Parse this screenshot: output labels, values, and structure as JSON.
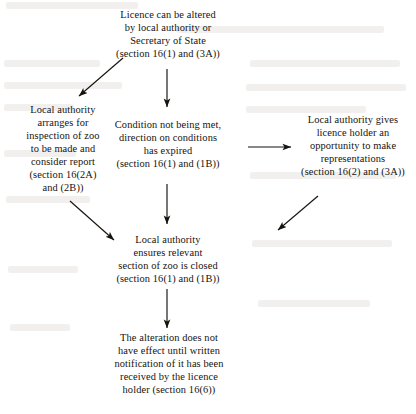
{
  "diagram": {
    "ink_color": "#16130f",
    "background_color": "#ffffff"
  },
  "nodes": {
    "top": {
      "name": "licence-can-be-altered",
      "lines": [
        "Licence can be altered",
        "by local authority or",
        "Secretary of State",
        "(section 16(1) and (3A))"
      ]
    },
    "left": {
      "name": "local-authority-arranges-inspection",
      "lines": [
        "Local authority",
        "arranges for",
        "inspection of zoo",
        "to be made and",
        "consider report",
        "(section 16(2A)",
        "and (2B))"
      ]
    },
    "center": {
      "name": "condition-not-being-met",
      "lines": [
        "Condition not being met,",
        "direction on conditions",
        "has expired",
        "(section 16(1) and (1B))"
      ]
    },
    "right": {
      "name": "opportunity-to-make-representations",
      "lines": [
        "Local authority gives",
        "licence holder an",
        "opportunity to make",
        "representations",
        "(section 16(2) and (3A))"
      ]
    },
    "closure": {
      "name": "local-authority-ensures-section-closed",
      "lines": [
        "Local authority",
        "ensures relevant",
        "section of zoo is closed",
        "(section 16(1) and (1B))"
      ]
    },
    "bottom": {
      "name": "alteration-effect-on-notification",
      "lines": [
        "The alteration does not",
        "have effect until written",
        "notification of it has been",
        "received by the licence",
        "holder (section 16(6))"
      ]
    }
  },
  "edges": [
    {
      "id": "top-to-left",
      "label": "arrow down-left from licence-can-be-altered to local-authority-arranges-inspection",
      "direction": "down-left"
    },
    {
      "id": "top-to-center",
      "label": "arrow down from licence-can-be-altered to condition-not-being-met",
      "direction": "down"
    },
    {
      "id": "center-to-right",
      "label": "arrow right from condition-not-being-met to opportunity-to-make-representations",
      "direction": "right"
    },
    {
      "id": "center-to-closure",
      "label": "arrow down from condition-not-being-met to local-authority-ensures-section-closed",
      "direction": "down"
    },
    {
      "id": "left-to-closure",
      "label": "arrow down-right from local-authority-arranges-inspection to local-authority-ensures-section-closed",
      "direction": "down-right"
    },
    {
      "id": "right-to-closure",
      "label": "arrow down-left from opportunity-to-make-representations to local-authority-ensures-section-closed",
      "direction": "down-left"
    },
    {
      "id": "closure-to-bottom",
      "label": "arrow down from local-authority-ensures-section-closed to alteration-effect-on-notification",
      "direction": "down"
    }
  ]
}
